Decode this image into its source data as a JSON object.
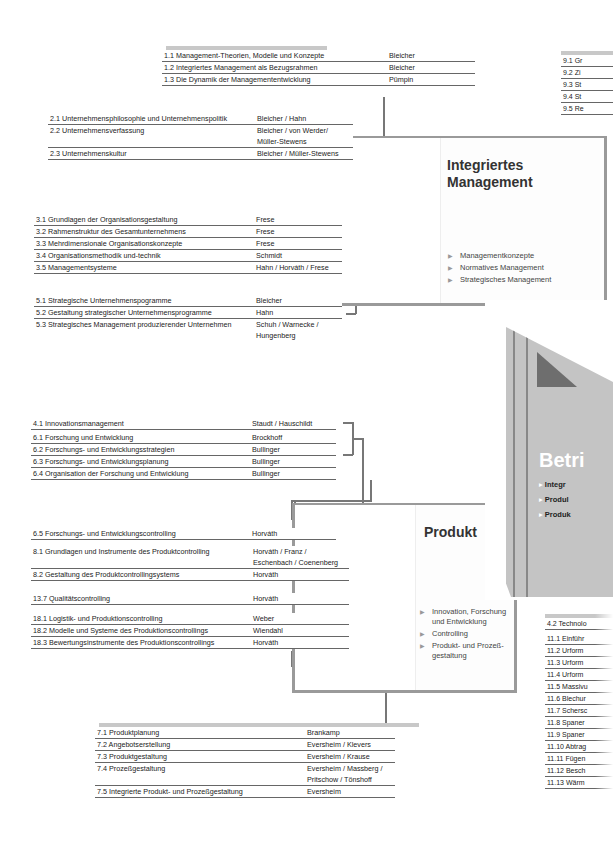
{
  "tables": {
    "t1": [
      {
        "title": "1.1 Management-Theorien, Modelle und Konzepte",
        "author": "Bleicher"
      },
      {
        "title": "1.2 Integriertes Management als Bezugsrahmen",
        "author": "Bleicher"
      },
      {
        "title": "1.3 Die Dynamik der Managemententwicklung",
        "author": "Pümpin"
      }
    ],
    "t2": [
      {
        "title": "2.1 Unternehmensphilosophie und Unternehmenspolitik",
        "author": "Bleicher / Hahn"
      },
      {
        "title": "2.2 Unternehmensverfassung",
        "author": "Bleicher / von Werder/\nMüller-Stewens"
      },
      {
        "title": "2.3 Unternehmenskultur",
        "author": "Bleicher / Müller-Stewens"
      }
    ],
    "t3": [
      {
        "title": "3.1 Grundlagen der Organisationsgestaltung",
        "author": "Frese"
      },
      {
        "title": "3.2 Rahmenstruktur des Gesamtunternehmens",
        "author": "Frese"
      },
      {
        "title": "3.3 Mehrdimensionale Organisationskonzepte",
        "author": "Frese"
      },
      {
        "title": "3.4 Organisationsmethodik und-technik",
        "author": "Schmidt"
      },
      {
        "title": "3.5 Managementsysteme",
        "author": "Hahn / Horváth / Frese"
      }
    ],
    "t5": [
      {
        "title": "5.1 Strategische Unternehmenspogramme",
        "author": "Bleicher"
      },
      {
        "title": "5.2 Gestaltung strategischer Unternehmensprogramme",
        "author": "Hahn"
      },
      {
        "title": "5.3 Strategisches Management produzierender Unternehmen",
        "author": "Schuh / Warnecke /\nHungenberg"
      }
    ],
    "t4": [
      {
        "title": "4.1 Innovationsmanagement",
        "author": "Staudt / Hauschildt"
      }
    ],
    "t6": [
      {
        "title": "6.1 Forschung und Entwicklung",
        "author": "Brockhoff"
      },
      {
        "title": "6.2 Forschungs- und Entwicklungsstrategien",
        "author": "Bullinger"
      },
      {
        "title": "6.3 Forschungs- und Entwicklungsplanung",
        "author": "Bullinger"
      },
      {
        "title": "6.4 Organisation der Forschung und Entwicklung",
        "author": "Bullinger"
      }
    ],
    "t65": [
      {
        "title": "6.5 Forschungs- und Entwicklungscontrolling",
        "author": "Horváth"
      }
    ],
    "t8": [
      {
        "title": "8.1 Grundlagen und Instrumente des Produktcontrolling",
        "author": "Horváth / Franz /\nEschenbach / Coenenberg"
      },
      {
        "title": "8.2 Gestaltung des Produktcontrollingsystems",
        "author": "Horváth"
      }
    ],
    "t13": [
      {
        "title": "13.7 Qualitätscontrolling",
        "author": "Horváth"
      }
    ],
    "t18": [
      {
        "title": "18.1 Logistik- und Produktionscontrolling",
        "author": "Weber"
      },
      {
        "title": "18.2 Modelle und Systeme des Produktionscontrollings",
        "author": "Wiendahl"
      },
      {
        "title": "18.3 Bewertungsinstrumente des Produktionscontrollings",
        "author": "Horváth"
      }
    ],
    "t7": [
      {
        "title": "7.1 Produktplanung",
        "author": "Brankamp"
      },
      {
        "title": "7.2 Angebotserstellung",
        "author": "Eversheim / Klevers"
      },
      {
        "title": "7.3 Produktgestaltung",
        "author": "Eversheim / Krause"
      },
      {
        "title": "7.4 Prozeßgestaltung",
        "author": "Eversheim / Massberg /\nPritschow / Tönshoff"
      },
      {
        "title": "7.5 Integrierte Produkt- und Prozeßgestaltung",
        "author": "Eversheim"
      }
    ]
  },
  "side_top": [
    "9.1 Gr",
    "9.2 Zi",
    "9.3 St",
    "9.4 St",
    "9.5 Re"
  ],
  "side_bottom": [
    "4.2 Technolo",
    "11.1 Einführ",
    "11.2 Urform",
    "11.3 Urform",
    "11.4 Urform",
    "11.5 Massivu",
    "11.6 Blechur",
    "11.7 Schersc",
    "11.8 Spaner",
    "11.9 Spaner",
    "11.10 Abtrag",
    "11.11 Fügen",
    "11.12 Besch",
    "11.13 Wärm"
  ],
  "book_integriert": {
    "title_line1": "Integriertes",
    "title_line2": "Management",
    "bullets": [
      "Managementkonzepte",
      "Normatives Management",
      "Strategisches Management"
    ]
  },
  "book_produkt": {
    "title": "Produkt",
    "bullets": [
      "Innovation, Forschung\nund Entwicklung",
      "Controlling",
      "Produkt- und Prozeß-\ngestaltung"
    ]
  },
  "cover": {
    "title": "Betri",
    "bullets": [
      "Integr",
      "Produl",
      "Produk"
    ]
  },
  "colors": {
    "line": "#777777",
    "shade": "#c8c8c8",
    "cover": "#c4c4c4",
    "cover_dark": "#6e6e6e"
  }
}
